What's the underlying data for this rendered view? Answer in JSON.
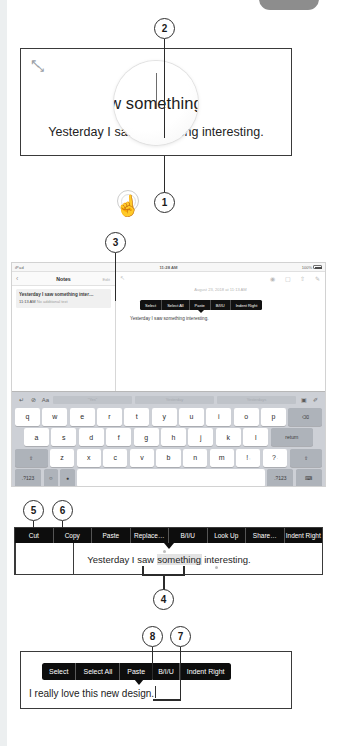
{
  "figure": {
    "callouts": [
      {
        "id": "1",
        "number": "1"
      },
      {
        "id": "2",
        "number": "2"
      },
      {
        "id": "3",
        "number": "3"
      },
      {
        "id": "4",
        "number": "4"
      },
      {
        "id": "5",
        "number": "5"
      },
      {
        "id": "6",
        "number": "6"
      },
      {
        "id": "7",
        "number": "7"
      },
      {
        "id": "8",
        "number": "8"
      }
    ]
  },
  "magnifier_panel": {
    "resize_icon_a": "↖",
    "resize_icon_b": "↘",
    "loupe_text": "w something",
    "body_text": "Yesterday I saw something interesting.",
    "cursor_icon": "☝"
  },
  "ipad_panel": {
    "status_bar": {
      "device": "iPad",
      "wifi_icon": "▼",
      "time": "11:28 AM",
      "battery_percent": "100%"
    },
    "sidebar": {
      "back_icon": "‹",
      "title": "Notes",
      "edit_label": "Edit",
      "note": {
        "title": "Yesterday I saw something inter…",
        "time": "11:13 AM",
        "preview": "No additional text"
      }
    },
    "content": {
      "resize_icon": "↖",
      "toolbar_icons": [
        "checklist-icon",
        "trash-icon",
        "share-icon",
        "compose-icon"
      ],
      "toolbar_glyphs": [
        "✓",
        "Ὕ1",
        "⇧",
        "✎"
      ],
      "date": "August 23, 2018 at 11:13 AM",
      "note_text": "Yesterday I saw something interesting.",
      "popup_items": [
        "Select",
        "Select All",
        "Paste",
        "B/I/U",
        "Indent Right"
      ]
    },
    "keyboard": {
      "predict_glyphs": [
        "↵",
        "⊘",
        "Aa"
      ],
      "predict_words": [
        "\"Yes\"",
        "Yesterday",
        "Yesterdays"
      ],
      "right_glyphs": [
        "▣",
        "✐"
      ],
      "row1": [
        "q",
        "w",
        "e",
        "r",
        "t",
        "y",
        "u",
        "i",
        "o",
        "p"
      ],
      "backspace": "⌫",
      "row2": [
        "a",
        "s",
        "d",
        "f",
        "g",
        "h",
        "j",
        "k",
        "l"
      ],
      "return_label": "return",
      "shift_icon": "⇧",
      "row3": [
        "z",
        "x",
        "c",
        "v",
        "b",
        "n",
        "m"
      ],
      "punct1": "!",
      "punct1_sub": ",",
      "punct2": "?",
      "punct2_sub": ".",
      "numeric_label": ".?123",
      "emoji_icon": "☺",
      "mic_icon": "Ἲ4",
      "dismiss_icon": "⌨",
      "space_label": ""
    }
  },
  "cutcopy_panel": {
    "menu_items": [
      "Cut",
      "Copy",
      "Paste",
      "Replace…",
      "B/I/U",
      "Look Up",
      "Share…",
      "Indent Right"
    ],
    "sentence_before": "Yesterday I saw ",
    "sentence_selected": "something",
    "sentence_after": " interesting."
  },
  "select_panel": {
    "menu_items": [
      "Select",
      "Select All",
      "Paste",
      "B/I/U",
      "Indent Right"
    ],
    "sentence": "I really love this new design."
  },
  "colors": {
    "menu_background": "#0d0d0d",
    "menu_text": "#ffffff",
    "panel_border": "#3a3a3a",
    "keyboard_background": "#cdd0d6",
    "key_background": "#ffffff",
    "key_dark_background": "#aeb3ba",
    "selection_highlight": "#e3e3e3",
    "page_background": "#ffffff"
  }
}
